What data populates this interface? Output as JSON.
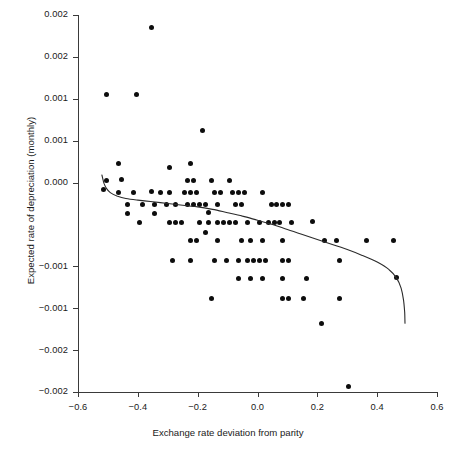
{
  "chart_data": {
    "type": "scatter",
    "title": "",
    "xlabel": "Exchange rate deviation from parity",
    "ylabel": "Expected rate of depreciation (monthly)",
    "xlim": [
      -0.6,
      0.6
    ],
    "ylim": [
      -0.002,
      0.0025
    ],
    "grid": false,
    "legend": null,
    "xticks": [
      -0.6,
      -0.4,
      -0.2,
      0.0,
      0.2,
      0.4,
      0.6
    ],
    "xticklabels": [
      "−0.6",
      "−0.4",
      "−0.2",
      "0.0",
      "0.2",
      "0.4",
      "0.6"
    ],
    "yticks": [
      0.0025,
      0.002,
      0.0015,
      0.001,
      0.0005,
      0.0,
      -0.0005,
      -0.001,
      -0.0015,
      -0.002
    ],
    "yticklabels": [
      "0.002",
      "0.002",
      "0.001",
      "0.001",
      "0.000",
      "0.000",
      "-0.001",
      "-0.001",
      "-0.002",
      "-0.002"
    ],
    "yticklabels_visible": [
      "0.002",
      "0.002",
      "0.001",
      "0.001",
      "0.000",
      "−0.001",
      "−0.001",
      "−0.002",
      "−0.002"
    ],
    "marker": "filled-circle",
    "marker_color": "#0d0d0d",
    "marker_size": 5,
    "curve_color": "#2b2b2b",
    "curve_label": "fitted regression curve",
    "x": [
      -0.355,
      -0.505,
      -0.405,
      -0.185,
      -0.465,
      -0.295,
      -0.225,
      -0.505,
      -0.455,
      -0.235,
      -0.215,
      -0.155,
      -0.095,
      -0.515,
      -0.465,
      -0.415,
      -0.355,
      -0.325,
      -0.295,
      -0.245,
      -0.225,
      -0.205,
      -0.145,
      -0.125,
      -0.085,
      -0.065,
      -0.045,
      0.015,
      -0.435,
      -0.385,
      -0.345,
      -0.305,
      -0.275,
      -0.235,
      -0.215,
      -0.195,
      -0.175,
      -0.135,
      -0.075,
      -0.055,
      0.045,
      0.065,
      0.085,
      0.105,
      -0.435,
      -0.345,
      -0.165,
      -0.395,
      -0.295,
      -0.275,
      -0.255,
      -0.195,
      -0.165,
      -0.135,
      -0.115,
      -0.095,
      -0.075,
      -0.035,
      0.005,
      0.035,
      0.055,
      0.075,
      0.115,
      0.185,
      -0.175,
      -0.225,
      -0.205,
      -0.135,
      -0.055,
      -0.025,
      0.015,
      0.085,
      0.225,
      0.265,
      0.365,
      0.455,
      -0.285,
      -0.225,
      -0.145,
      -0.105,
      -0.065,
      -0.035,
      -0.015,
      0.005,
      0.025,
      0.085,
      0.105,
      0.275,
      -0.065,
      -0.025,
      0.015,
      0.085,
      0.165,
      0.465,
      -0.155,
      0.085,
      0.105,
      0.155,
      0.275,
      0.215,
      0.305
    ],
    "y": [
      0.00235,
      0.00155,
      0.00155,
      0.00112,
      0.00073,
      0.00068,
      0.00073,
      0.00052,
      0.00054,
      0.00053,
      0.00053,
      0.00053,
      0.00053,
      0.00042,
      0.00038,
      0.00038,
      0.00039,
      0.00038,
      0.00038,
      0.00038,
      0.00038,
      0.00038,
      0.00038,
      0.00038,
      0.00038,
      0.00038,
      0.00038,
      0.00038,
      0.00024,
      0.00024,
      0.00024,
      0.00024,
      0.00024,
      0.00024,
      0.00024,
      0.00024,
      0.00024,
      0.00024,
      0.00024,
      0.00024,
      0.00024,
      0.00024,
      0.00024,
      0.00024,
      0.00013,
      0.00013,
      0.00014,
      2e-05,
      2e-05,
      2e-05,
      2e-05,
      2e-05,
      2e-05,
      2e-05,
      2e-05,
      2e-05,
      2e-05,
      2e-05,
      2e-05,
      2e-05,
      2e-05,
      2e-05,
      2e-05,
      3e-05,
      -9e-05,
      -0.00019,
      -0.00019,
      -0.00019,
      -0.00019,
      -0.00019,
      -0.00019,
      -0.00019,
      -0.00019,
      -0.00019,
      -0.00019,
      -0.00019,
      -0.00043,
      -0.00043,
      -0.00043,
      -0.00043,
      -0.00043,
      -0.00043,
      -0.00043,
      -0.00043,
      -0.00043,
      -0.00043,
      -0.00043,
      -0.00043,
      -0.00065,
      -0.00065,
      -0.00065,
      -0.00065,
      -0.00065,
      -0.00063,
      -0.00088,
      -0.00088,
      -0.00088,
      -0.00088,
      -0.00088,
      -0.00118,
      -0.00193
    ],
    "curve_points": [
      [
        -0.52,
        0.00059
      ],
      [
        -0.513,
        0.00049
      ],
      [
        -0.505,
        0.00043
      ],
      [
        -0.492,
        0.00038
      ],
      [
        -0.47,
        0.00034
      ],
      [
        -0.44,
        0.00031
      ],
      [
        -0.4,
        0.00029
      ],
      [
        -0.35,
        0.00027
      ],
      [
        -0.3,
        0.00025
      ],
      [
        -0.25,
        0.00023
      ],
      [
        -0.2,
        0.00021
      ],
      [
        -0.15,
        0.00018
      ],
      [
        -0.1,
        0.00014
      ],
      [
        -0.05,
        0.0001
      ],
      [
        0.0,
        5e-05
      ],
      [
        0.05,
        0.0
      ],
      [
        0.1,
        -6e-05
      ],
      [
        0.15,
        -0.00012
      ],
      [
        0.2,
        -0.00018
      ],
      [
        0.25,
        -0.00024
      ],
      [
        0.3,
        -0.0003
      ],
      [
        0.35,
        -0.00037
      ],
      [
        0.4,
        -0.00045
      ],
      [
        0.44,
        -0.00054
      ],
      [
        0.465,
        -0.00064
      ],
      [
        0.48,
        -0.00076
      ],
      [
        0.488,
        -0.0009
      ],
      [
        0.492,
        -0.00105
      ],
      [
        0.493,
        -0.00118
      ]
    ]
  }
}
